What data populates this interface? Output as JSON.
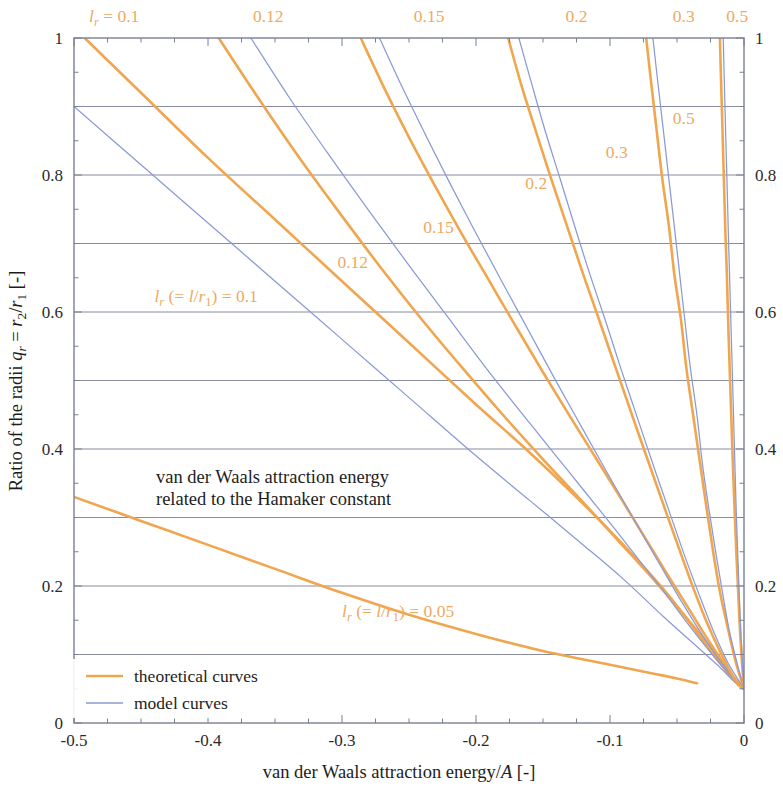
{
  "chart_data": {
    "type": "line",
    "title": "",
    "annotation_main": "van der Waals attraction energy",
    "annotation_main_line2": "related to the Hamaker constant",
    "xlabel": "van der Waals attraction energy/A  [-]",
    "ylabel": "Ratio of the radii q_r = r_2/r_1  [-]",
    "xlim": [
      -0.5,
      0
    ],
    "ylim": [
      0,
      1
    ],
    "xticks": [
      -0.5,
      -0.4,
      -0.3,
      -0.2,
      -0.1,
      0
    ],
    "xticklabels": [
      "-0.5",
      "-0.4",
      "-0.3",
      "-0.2",
      "-0.1",
      "0"
    ],
    "yticks": [
      0,
      0.2,
      0.4,
      0.6,
      0.8,
      1
    ],
    "yticklabels": [
      "0",
      "0.2",
      "0.4",
      "0.6",
      "0.8",
      "1"
    ],
    "y_minor_step": 0.05,
    "x_minor_step": 0.025,
    "grid": "horizontal gridlines every 0.1",
    "grid_color": "#7a7f93",
    "right_axis_mirror": true,
    "top_axis_ticks": true,
    "legend": {
      "position": "bottom-left inside plot",
      "entries": [
        {
          "label": "theoretical curves",
          "color": "#f0a64e"
        },
        {
          "label": "model curves",
          "color": "#8b9ad6"
        }
      ]
    },
    "top_labels": [
      {
        "text": "l_r = 0.1",
        "x": -0.47
      },
      {
        "text": "0.12",
        "x": -0.355
      },
      {
        "text": "0.15",
        "x": -0.235
      },
      {
        "text": "0.2",
        "x": -0.125
      },
      {
        "text": "0.3",
        "x": -0.045
      },
      {
        "text": "0.5",
        "x": -0.005
      }
    ],
    "inline_labels": [
      {
        "text": "l_r (= l/r_1) = 0.1",
        "x": -0.44,
        "y": 0.615
      },
      {
        "text": "0.12",
        "x": -0.292,
        "y": 0.665
      },
      {
        "text": "0.15",
        "x": -0.228,
        "y": 0.715
      },
      {
        "text": "0.2",
        "x": -0.155,
        "y": 0.78
      },
      {
        "text": "0.3",
        "x": -0.095,
        "y": 0.825
      },
      {
        "text": "0.5",
        "x": -0.045,
        "y": 0.875
      },
      {
        "text": "l_r (= l/r_1) = 0.05",
        "x": -0.3,
        "y": 0.155
      }
    ],
    "series": [
      {
        "name": "theoretical l_r = 0.05",
        "kind": "theoretical",
        "color": "#f0a64e",
        "points": [
          [
            -0.5,
            0.33
          ],
          [
            -0.45,
            0.295
          ],
          [
            -0.4,
            0.26
          ],
          [
            -0.35,
            0.225
          ],
          [
            -0.3,
            0.19
          ],
          [
            -0.25,
            0.158
          ],
          [
            -0.2,
            0.13
          ],
          [
            -0.15,
            0.105
          ],
          [
            -0.1,
            0.085
          ],
          [
            -0.07,
            0.073
          ],
          [
            -0.05,
            0.065
          ],
          [
            -0.035,
            0.058
          ]
        ]
      },
      {
        "name": "theoretical l_r = 0.1",
        "kind": "theoretical",
        "color": "#f0a64e",
        "points": [
          [
            -0.492,
            1.0
          ],
          [
            -0.45,
            0.92
          ],
          [
            -0.4,
            0.825
          ],
          [
            -0.35,
            0.735
          ],
          [
            -0.3,
            0.645
          ],
          [
            -0.25,
            0.555
          ],
          [
            -0.2,
            0.465
          ],
          [
            -0.16,
            0.395
          ],
          [
            -0.12,
            0.32
          ],
          [
            -0.09,
            0.26
          ],
          [
            -0.06,
            0.195
          ],
          [
            -0.04,
            0.145
          ],
          [
            -0.025,
            0.105
          ],
          [
            -0.012,
            0.073
          ],
          [
            -0.004,
            0.055
          ],
          [
            0,
            0.05
          ]
        ]
      },
      {
        "name": "model l_r = 0.1",
        "kind": "model",
        "color": "#8b9ad6",
        "points": [
          [
            -0.5,
            0.9
          ],
          [
            -0.45,
            0.815
          ],
          [
            -0.4,
            0.73
          ],
          [
            -0.35,
            0.645
          ],
          [
            -0.3,
            0.56
          ],
          [
            -0.25,
            0.475
          ],
          [
            -0.2,
            0.39
          ],
          [
            -0.16,
            0.325
          ],
          [
            -0.12,
            0.26
          ],
          [
            -0.09,
            0.21
          ],
          [
            -0.06,
            0.155
          ],
          [
            -0.04,
            0.12
          ],
          [
            -0.02,
            0.085
          ],
          [
            -0.008,
            0.062
          ],
          [
            0,
            0.05
          ]
        ]
      },
      {
        "name": "theoretical l_r = 0.12",
        "kind": "theoretical",
        "color": "#f0a64e",
        "points": [
          [
            -0.392,
            1.0
          ],
          [
            -0.36,
            0.905
          ],
          [
            -0.33,
            0.82
          ],
          [
            -0.3,
            0.74
          ],
          [
            -0.27,
            0.662
          ],
          [
            -0.24,
            0.588
          ],
          [
            -0.21,
            0.518
          ],
          [
            -0.18,
            0.45
          ],
          [
            -0.15,
            0.385
          ],
          [
            -0.12,
            0.322
          ],
          [
            -0.09,
            0.258
          ],
          [
            -0.07,
            0.215
          ],
          [
            -0.05,
            0.17
          ],
          [
            -0.035,
            0.135
          ],
          [
            -0.02,
            0.098
          ],
          [
            -0.01,
            0.072
          ],
          [
            -0.003,
            0.055
          ],
          [
            0,
            0.05
          ]
        ]
      },
      {
        "name": "model l_r = 0.12",
        "kind": "model",
        "color": "#8b9ad6",
        "points": [
          [
            -0.368,
            1.0
          ],
          [
            -0.34,
            0.915
          ],
          [
            -0.31,
            0.83
          ],
          [
            -0.28,
            0.748
          ],
          [
            -0.25,
            0.668
          ],
          [
            -0.22,
            0.59
          ],
          [
            -0.19,
            0.512
          ],
          [
            -0.16,
            0.438
          ],
          [
            -0.13,
            0.365
          ],
          [
            -0.1,
            0.292
          ],
          [
            -0.08,
            0.242
          ],
          [
            -0.06,
            0.192
          ],
          [
            -0.04,
            0.14
          ],
          [
            -0.025,
            0.103
          ],
          [
            -0.012,
            0.073
          ],
          [
            0,
            0.05
          ]
        ]
      },
      {
        "name": "theoretical l_r = 0.15",
        "kind": "theoretical",
        "color": "#f0a64e",
        "points": [
          [
            -0.286,
            1.0
          ],
          [
            -0.268,
            0.925
          ],
          [
            -0.25,
            0.855
          ],
          [
            -0.23,
            0.782
          ],
          [
            -0.21,
            0.712
          ],
          [
            -0.19,
            0.645
          ],
          [
            -0.17,
            0.578
          ],
          [
            -0.15,
            0.512
          ],
          [
            -0.13,
            0.448
          ],
          [
            -0.11,
            0.385
          ],
          [
            -0.09,
            0.322
          ],
          [
            -0.07,
            0.258
          ],
          [
            -0.055,
            0.21
          ],
          [
            -0.04,
            0.163
          ],
          [
            -0.028,
            0.125
          ],
          [
            -0.016,
            0.09
          ],
          [
            -0.006,
            0.062
          ],
          [
            0,
            0.05
          ]
        ]
      },
      {
        "name": "model l_r = 0.15",
        "kind": "model",
        "color": "#8b9ad6",
        "points": [
          [
            -0.272,
            1.0
          ],
          [
            -0.255,
            0.928
          ],
          [
            -0.238,
            0.86
          ],
          [
            -0.22,
            0.79
          ],
          [
            -0.2,
            0.715
          ],
          [
            -0.18,
            0.642
          ],
          [
            -0.16,
            0.57
          ],
          [
            -0.14,
            0.498
          ],
          [
            -0.12,
            0.428
          ],
          [
            -0.1,
            0.358
          ],
          [
            -0.08,
            0.29
          ],
          [
            -0.06,
            0.222
          ],
          [
            -0.045,
            0.172
          ],
          [
            -0.03,
            0.125
          ],
          [
            -0.016,
            0.086
          ],
          [
            0,
            0.05
          ]
        ]
      },
      {
        "name": "theoretical l_r = 0.2",
        "kind": "theoretical",
        "color": "#f0a64e",
        "points": [
          [
            -0.176,
            1.0
          ],
          [
            -0.166,
            0.93
          ],
          [
            -0.155,
            0.862
          ],
          [
            -0.144,
            0.795
          ],
          [
            -0.132,
            0.725
          ],
          [
            -0.12,
            0.655
          ],
          [
            -0.108,
            0.588
          ],
          [
            -0.096,
            0.52
          ],
          [
            -0.084,
            0.452
          ],
          [
            -0.072,
            0.385
          ],
          [
            -0.06,
            0.318
          ],
          [
            -0.048,
            0.252
          ],
          [
            -0.038,
            0.198
          ],
          [
            -0.028,
            0.148
          ],
          [
            -0.018,
            0.105
          ],
          [
            -0.008,
            0.068
          ],
          [
            0,
            0.05
          ]
        ]
      },
      {
        "name": "model l_r = 0.2",
        "kind": "model",
        "color": "#8b9ad6",
        "points": [
          [
            -0.168,
            1.0
          ],
          [
            -0.158,
            0.93
          ],
          [
            -0.148,
            0.862
          ],
          [
            -0.137,
            0.793
          ],
          [
            -0.126,
            0.723
          ],
          [
            -0.115,
            0.655
          ],
          [
            -0.103,
            0.585
          ],
          [
            -0.092,
            0.518
          ],
          [
            -0.08,
            0.448
          ],
          [
            -0.068,
            0.378
          ],
          [
            -0.056,
            0.31
          ],
          [
            -0.045,
            0.248
          ],
          [
            -0.034,
            0.19
          ],
          [
            -0.023,
            0.135
          ],
          [
            -0.012,
            0.088
          ],
          [
            0,
            0.05
          ]
        ]
      },
      {
        "name": "theoretical l_r = 0.3",
        "kind": "theoretical",
        "color": "#f0a64e",
        "points": [
          [
            -0.073,
            1.0
          ],
          [
            -0.069,
            0.93
          ],
          [
            -0.065,
            0.862
          ],
          [
            -0.061,
            0.795
          ],
          [
            -0.056,
            0.725
          ],
          [
            -0.052,
            0.655
          ],
          [
            -0.047,
            0.588
          ],
          [
            -0.043,
            0.518
          ],
          [
            -0.038,
            0.45
          ],
          [
            -0.033,
            0.382
          ],
          [
            -0.028,
            0.315
          ],
          [
            -0.023,
            0.25
          ],
          [
            -0.018,
            0.192
          ],
          [
            -0.012,
            0.138
          ],
          [
            -0.006,
            0.088
          ],
          [
            0,
            0.05
          ]
        ]
      },
      {
        "name": "model l_r = 0.3",
        "kind": "model",
        "color": "#8b9ad6",
        "points": [
          [
            -0.068,
            1.0
          ],
          [
            -0.064,
            0.93
          ],
          [
            -0.06,
            0.862
          ],
          [
            -0.056,
            0.793
          ],
          [
            -0.052,
            0.725
          ],
          [
            -0.048,
            0.655
          ],
          [
            -0.044,
            0.585
          ],
          [
            -0.04,
            0.518
          ],
          [
            -0.035,
            0.448
          ],
          [
            -0.031,
            0.378
          ],
          [
            -0.026,
            0.31
          ],
          [
            -0.021,
            0.248
          ],
          [
            -0.016,
            0.19
          ],
          [
            -0.011,
            0.135
          ],
          [
            -0.005,
            0.086
          ],
          [
            0,
            0.05
          ]
        ]
      },
      {
        "name": "theoretical l_r = 0.5",
        "kind": "theoretical",
        "color": "#f0a64e",
        "points": [
          [
            -0.018,
            1.0
          ],
          [
            -0.017,
            0.93
          ],
          [
            -0.016,
            0.862
          ],
          [
            -0.015,
            0.793
          ],
          [
            -0.014,
            0.723
          ],
          [
            -0.0128,
            0.655
          ],
          [
            -0.0118,
            0.585
          ],
          [
            -0.0107,
            0.518
          ],
          [
            -0.0095,
            0.448
          ],
          [
            -0.0083,
            0.378
          ],
          [
            -0.007,
            0.31
          ],
          [
            -0.0057,
            0.248
          ],
          [
            -0.0043,
            0.19
          ],
          [
            -0.003,
            0.135
          ],
          [
            -0.0015,
            0.088
          ],
          [
            0,
            0.05
          ]
        ]
      },
      {
        "name": "model l_r = 0.5",
        "kind": "model",
        "color": "#8b9ad6",
        "points": [
          [
            -0.0155,
            1.0
          ],
          [
            -0.0146,
            0.93
          ],
          [
            -0.0137,
            0.862
          ],
          [
            -0.0127,
            0.793
          ],
          [
            -0.0118,
            0.723
          ],
          [
            -0.0108,
            0.655
          ],
          [
            -0.0098,
            0.585
          ],
          [
            -0.0088,
            0.518
          ],
          [
            -0.0078,
            0.448
          ],
          [
            -0.0068,
            0.378
          ],
          [
            -0.0058,
            0.31
          ],
          [
            -0.0047,
            0.248
          ],
          [
            -0.0036,
            0.19
          ],
          [
            -0.0024,
            0.135
          ],
          [
            -0.0012,
            0.088
          ],
          [
            0,
            0.05
          ]
        ]
      }
    ]
  },
  "axes": {
    "x_title_plain": "van der Waals attraction energy/",
    "x_title_italic": "A",
    "x_title_unit": " [-]",
    "y_title_p1": "Ratio of the radii ",
    "y_title_q": "q",
    "y_title_qsub": "r",
    "y_title_eq": " = ",
    "y_title_r2": "r",
    "y_title_r2sub": "2",
    "y_title_slash": "/",
    "y_title_r1": "r",
    "y_title_r1sub": "1",
    "y_title_unit": "  [-]"
  },
  "labels": {
    "top_first_lead": "l",
    "top_first_sub": "r",
    "top_first_rest": " = 0.1",
    "top_012": "0.12",
    "top_015": "0.15",
    "top_02": "0.2",
    "top_03": "0.3",
    "top_05": "0.5",
    "inline_012": "0.12",
    "inline_015": "0.15",
    "inline_02": "0.2",
    "inline_03": "0.3",
    "inline_05": "0.5",
    "lr_lead": "l",
    "lr_sub": "r",
    "lr_paren_open": " (= ",
    "lr_l": "l",
    "lr_slash": "/",
    "lr_r": "r",
    "lr_rsub": "1",
    "lr_paren_close": ") = ",
    "lr_val_01": "0.1",
    "lr_val_005": "0.05"
  },
  "annotation": {
    "line1": "van der Waals attraction energy",
    "line2": "related to the Hamaker constant"
  },
  "legend": {
    "theoretical": "theoretical curves",
    "model": "model curves"
  },
  "ticks": {
    "x": [
      "-0.5",
      "-0.4",
      "-0.3",
      "-0.2",
      "-0.1",
      "0"
    ],
    "y": [
      "0",
      "0.2",
      "0.4",
      "0.6",
      "0.8",
      "1"
    ]
  },
  "colors": {
    "theoretical": "#f0a64e",
    "model": "#8b9ad6",
    "axis": "#4a4a52",
    "grid": "#7a7f93"
  }
}
